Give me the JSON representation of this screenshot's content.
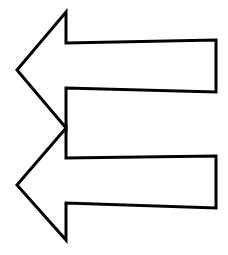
{
  "image": {
    "background": "#ffffff",
    "stroke_color": "#000000",
    "fill_color": "#ffffff",
    "stroke_width": 3
  },
  "arrows": [
    {
      "direction": "left",
      "points": "17,70 66,12 66,43 216,40 216,92 66,88 66,128"
    },
    {
      "direction": "left",
      "points": "17,185 66,128 66,158 216,156 216,208 66,203 66,240"
    }
  ]
}
